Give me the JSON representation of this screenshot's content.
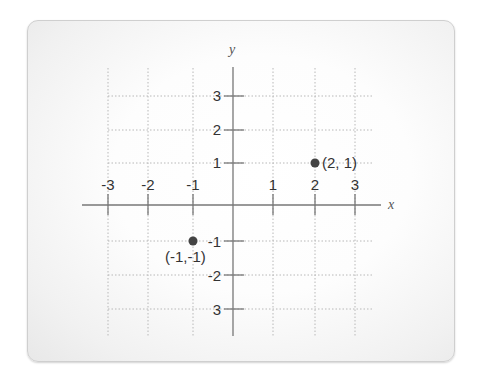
{
  "diagram": {
    "type": "coordinate-plane",
    "axes": {
      "x_label": "x",
      "y_label": "y",
      "x_ticks": [
        "-3",
        "-2",
        "-1",
        "1",
        "2",
        "3"
      ],
      "y_ticks": [
        "3",
        "2",
        "1",
        "-1",
        "-2",
        "3"
      ]
    },
    "points": [
      {
        "x": 2,
        "y": 1,
        "label": "(2, 1)"
      },
      {
        "x": -1,
        "y": -1,
        "label": "(-1,-1)"
      }
    ],
    "colors": {
      "axis": "#777777",
      "grid": "#b8b8b8",
      "point": "#444444",
      "card_border": "#cfcfcf"
    }
  }
}
